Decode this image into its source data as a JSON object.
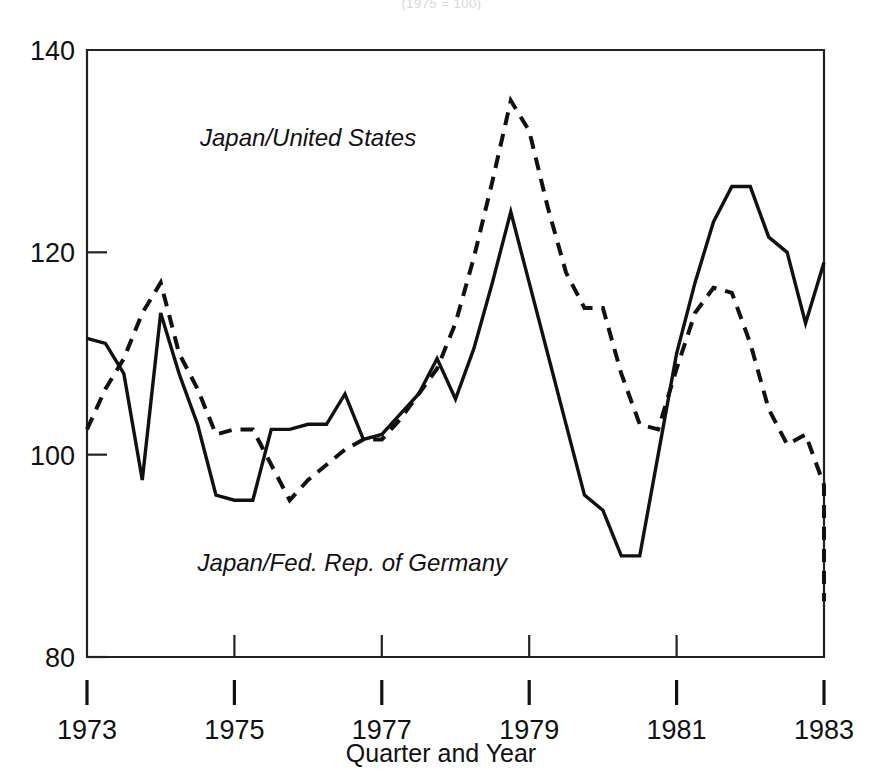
{
  "figure": {
    "cropped_top_caption": "(1975 = 100)",
    "background_color": "#ffffff",
    "ink_color": "#111111"
  },
  "chart_data": {
    "type": "line",
    "title": "",
    "subtitle": "",
    "xlabel": "Quarter and Year",
    "ylabel": "",
    "xlim": [
      1973.0,
      1983.0
    ],
    "ylim": [
      80,
      140
    ],
    "grid": false,
    "legend_position": "inline-annotation",
    "y_ticks": [
      80,
      100,
      120,
      140
    ],
    "y_tick_labels": [
      "80",
      "100",
      "120",
      "140"
    ],
    "x_ticks": [
      1973,
      1975,
      1977,
      1979,
      1981,
      1983
    ],
    "x_tick_labels": [
      "1973",
      "1975",
      "1977",
      "1979",
      "1981",
      "1983"
    ],
    "x_unit": "quarter",
    "series": [
      {
        "name": "Japan/United States",
        "style": "dashed",
        "color": "#111111",
        "label_x": 1976.0,
        "label_y": 130.5,
        "x": [
          1973.0,
          1973.25,
          1973.5,
          1973.75,
          1974.0,
          1974.25,
          1974.5,
          1974.75,
          1975.0,
          1975.25,
          1975.5,
          1975.75,
          1976.0,
          1976.25,
          1976.5,
          1976.75,
          1977.0,
          1977.25,
          1977.5,
          1977.75,
          1978.0,
          1978.25,
          1978.5,
          1978.75,
          1979.0,
          1979.25,
          1979.5,
          1979.75,
          1980.0,
          1980.25,
          1980.5,
          1980.75,
          1981.0,
          1981.25,
          1981.5,
          1981.75,
          1982.0,
          1982.25,
          1982.5,
          1982.75,
          1983.0
        ],
        "values": [
          102.5,
          106.5,
          109.5,
          114.0,
          117.0,
          110.0,
          106.5,
          102.0,
          102.5,
          102.5,
          99.0,
          95.5,
          97.5,
          99.0,
          100.5,
          101.5,
          101.5,
          103.5,
          106.0,
          108.5,
          113.0,
          119.5,
          127.0,
          135.0,
          132.0,
          124.5,
          118.0,
          114.5,
          114.5,
          108.0,
          103.0,
          102.5,
          108.5,
          114.0,
          116.5,
          116.0,
          111.0,
          104.5,
          101.0,
          102.0,
          97.0
        ],
        "values_tail": [
          92.0,
          86.0,
          85.5
        ]
      },
      {
        "name": "Japan/Fed. Rep. of Germany",
        "style": "solid",
        "color": "#111111",
        "label_x": 1976.6,
        "label_y": 88.5,
        "x": [
          1973.0,
          1973.25,
          1973.5,
          1973.75,
          1974.0,
          1974.25,
          1974.5,
          1974.75,
          1975.0,
          1975.25,
          1975.5,
          1975.75,
          1976.0,
          1976.25,
          1976.5,
          1976.75,
          1977.0,
          1977.25,
          1977.5,
          1977.75,
          1978.0,
          1978.25,
          1978.5,
          1978.75,
          1979.0,
          1979.25,
          1979.5,
          1979.75,
          1980.0,
          1980.25,
          1980.5,
          1980.75,
          1981.0,
          1981.25,
          1981.5,
          1981.75,
          1982.0,
          1982.25,
          1982.5,
          1982.75,
          1983.0
        ],
        "values": [
          111.5,
          111.0,
          108.0,
          97.5,
          114.0,
          108.0,
          103.0,
          96.0,
          95.5,
          95.5,
          102.5,
          102.5,
          103.0,
          103.0,
          106.0,
          101.5,
          102.0,
          104.0,
          106.0,
          109.5,
          105.5,
          110.5,
          117.0,
          124.0,
          117.0,
          110.0,
          103.0,
          96.0,
          94.5,
          90.0,
          90.0,
          100.0,
          110.0,
          117.0,
          123.0,
          126.5,
          126.5,
          121.5,
          120.0,
          113.0,
          119.0
        ]
      }
    ],
    "annotations": [
      {
        "text": "Japan/United States",
        "x": 1976.0,
        "y": 130.5,
        "italic": true
      },
      {
        "text": "Japan/Fed. Rep. of Germany",
        "x": 1976.6,
        "y": 88.5,
        "italic": true
      }
    ]
  }
}
